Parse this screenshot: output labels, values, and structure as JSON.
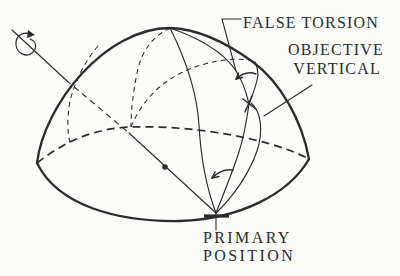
{
  "figure": {
    "colors": {
      "ink": "#2b2b2b",
      "paper": "#fbfbf9"
    },
    "labels": {
      "false_torsion": "FALSE TORSION",
      "objective_vertical_line1": "OBJECTIVE",
      "objective_vertical_line2": "VERTICAL",
      "primary_position_line1": "PRIMARY",
      "primary_position_line2": "POSITION"
    },
    "marks": {
      "rotation_arrow": "curved-rotation-arrow",
      "center_dot": "sphere-center-dot",
      "gaze_cross": "gaze-point-cross-tick",
      "false_torsion_angle": "angle-arc-with-arrowhead",
      "primary_angle": "angle-arc-with-arrowhead",
      "primary_tick": "primary-position-tick"
    }
  }
}
